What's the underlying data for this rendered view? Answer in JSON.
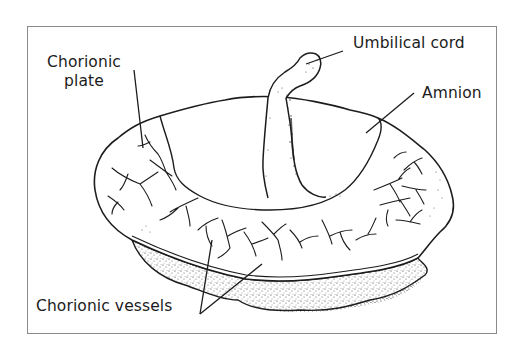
{
  "figure": {
    "border_color": "#8a8a8a",
    "ink_color": "#1c1c1c",
    "background": "#ffffff"
  },
  "labels": {
    "chorionic_plate_line1": "Chorionic",
    "chorionic_plate_line2": "plate",
    "umbilical_cord": "Umbilical cord",
    "amnion": "Amnion",
    "chorionic_vessels": "Chorionic vessels"
  },
  "parts": [
    {
      "name": "Chorionic plate",
      "leader": "single line to left portion of fetal surface"
    },
    {
      "name": "Umbilical cord",
      "leader": "single line to top of cord"
    },
    {
      "name": "Amnion",
      "leader": "single line to central membrane area"
    },
    {
      "name": "Chorionic vessels",
      "leader": "two lines diverging to branching vessels"
    }
  ]
}
